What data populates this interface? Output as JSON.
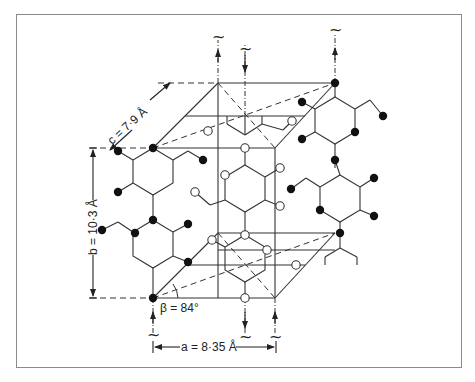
{
  "figure": {
    "labels": {
      "a": "a = 8·35 Å",
      "b": "b = 10·3 Å",
      "c": "c = 7·9 Å",
      "beta": "β = 84°"
    },
    "symbols": {
      "tilde": "~"
    },
    "legend_shapes": {
      "filled_atom": "filled circle",
      "open_atom": "open circle"
    },
    "colors": {
      "line": "#333333",
      "frame": "#8a8a8a",
      "background": "#ffffff"
    }
  }
}
